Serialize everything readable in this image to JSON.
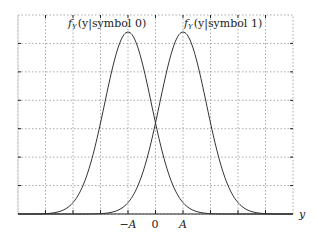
{
  "chart_data": {
    "type": "line",
    "title": "",
    "xlabel": "y",
    "ylabel": "",
    "xlim": [
      -5,
      5
    ],
    "ylim": [
      0,
      1
    ],
    "grid": true,
    "grid_style": "dotted",
    "x_tick_labels": [
      {
        "x": -1,
        "label": "−A"
      },
      {
        "x": 0,
        "label": "0"
      },
      {
        "x": 1,
        "label": "A"
      }
    ],
    "series": [
      {
        "name": "f_Y(y|symbol 0)",
        "mean": -1,
        "label_math": "f",
        "label_sub": "Y",
        "label_rest": "(y|symbol 0)"
      },
      {
        "name": "f_Y(y|symbol 1)",
        "mean": 1,
        "label_math": "f",
        "label_sub": "Y",
        "label_rest": "(y|symbol 1)"
      }
    ],
    "annotations": [
      {
        "text": "f_Y(y|symbol 0)",
        "near": "left peak"
      },
      {
        "text": "f_Y(y|symbol 1)",
        "near": "right peak"
      }
    ]
  },
  "axis": {
    "x_label": "y",
    "tick_neg_a": "−A",
    "tick_zero": "0",
    "tick_a": "A"
  },
  "labels": {
    "curve0_f": "f",
    "curve0_sub": "Y",
    "curve0_rest": "(y|symbol 0)",
    "curve1_f": "f",
    "curve1_sub": "Y",
    "curve1_rest": "(y|symbol 1)"
  },
  "colors": {
    "curve": "#333333",
    "grid": "#999999",
    "axis": "#222222"
  }
}
